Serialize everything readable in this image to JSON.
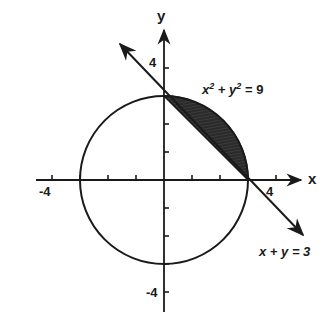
{
  "diagram": {
    "type": "coordinate-plane",
    "axes": {
      "x_label": "x",
      "y_label": "y",
      "x_ticks": [
        -4,
        -3,
        -2,
        -1,
        1,
        2,
        3,
        4
      ],
      "y_ticks": [
        -4,
        -3,
        -2,
        -1,
        1,
        2,
        3,
        4
      ],
      "x_tick_labels": {
        "neg": "-4",
        "pos": "4"
      },
      "y_tick_labels": {
        "pos": "4",
        "neg": "-4"
      }
    },
    "circle": {
      "equation": "x² + y² = 9",
      "label_base_x": "x",
      "label_sup_x": "2",
      "label_plus": " + ",
      "label_base_y": "y",
      "label_sup_y": "2",
      "label_rhs": " = 9",
      "center": [
        0,
        0
      ],
      "radius": 3
    },
    "line": {
      "equation": "x + y = 3",
      "label": "x + y = 3",
      "from": [
        -1.6,
        4.6
      ],
      "to": [
        5,
        -2
      ]
    },
    "shaded_region": {
      "description": "region between circle and line in first quadrant",
      "vertices": [
        [
          0,
          3
        ],
        [
          3,
          0
        ]
      ],
      "color": "#222222"
    },
    "colors": {
      "stroke": "#1a1a1a",
      "background": "#ffffff",
      "fill": "#2a2a2a"
    }
  }
}
